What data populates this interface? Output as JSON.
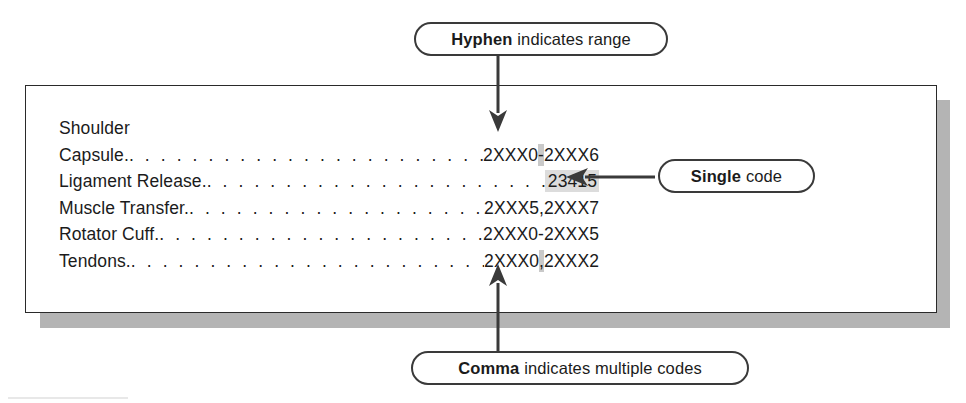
{
  "figure": {
    "heading": "Shoulder",
    "rows": [
      {
        "label": "Capsule.",
        "code_plain": "2XXX0-2XXX6",
        "code_pre": "2XXX0",
        "code_mark": "-",
        "code_post": "2XXX6",
        "mark_type": "hyphen",
        "highlight": "char"
      },
      {
        "label": "Ligament Release.",
        "code_plain": "23415",
        "code_pre": "",
        "code_mark": "23415",
        "code_post": "",
        "mark_type": "code",
        "highlight": "code"
      },
      {
        "label": "Muscle Transfer.",
        "code_plain": "2XXX5,2XXX7",
        "code_pre": "2XXX5",
        "code_mark": ",",
        "code_post": "2XXX7",
        "mark_type": "comma",
        "highlight": "none"
      },
      {
        "label": "Rotator Cuff.",
        "code_plain": "2XXX0-2XXX5",
        "code_pre": "2XXX0",
        "code_mark": "-",
        "code_post": "2XXX5",
        "mark_type": "hyphen",
        "highlight": "none"
      },
      {
        "label": "Tendons.",
        "code_plain": "2XXX0,2XXX2",
        "code_pre": "2XXX0",
        "code_mark": ",",
        "code_post": "2XXX2",
        "mark_type": "comma",
        "highlight": "char"
      }
    ],
    "leader_dots": ". . . . . . . . . . . . . . . . . . . . . . . . . . . . . . . . . . . . . . . . . . . . . . . . . . . . . . . . . ."
  },
  "callouts": {
    "hyphen": {
      "bold": "Hyphen",
      "rest": "indicates range"
    },
    "single": {
      "bold": "Single",
      "rest": "code"
    },
    "comma": {
      "bold": "Comma",
      "rest": "indicates multiple codes"
    }
  },
  "colors": {
    "line": "#3a3a3a",
    "text": "#1b1b1b",
    "box_border": "#2a2a2a",
    "box_shadow": "#b4b4b4",
    "highlight_code": "#dcdcdc",
    "highlight_char": "#c9c9c9",
    "page_background": "#ffffff"
  },
  "icons": {
    "arrow_down": "arrow-down-icon",
    "arrow_left": "arrow-left-icon",
    "arrow_up": "arrow-up-icon"
  }
}
